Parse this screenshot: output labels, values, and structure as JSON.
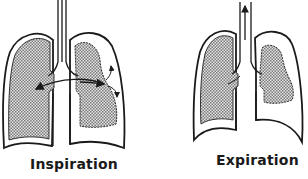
{
  "figure": {
    "panels": [
      {
        "id": "inspiration",
        "label": "Inspiration",
        "description": "Left lung inflated; air shunted from right lung across carina; right chest wall with outward arrows"
      },
      {
        "id": "expiration",
        "label": "Expiration",
        "description": "Air exits upward through trachea (arrow); right lung expands slightly"
      }
    ],
    "colors": {
      "stroke": "#1a1a1a",
      "lung_fill": "#bdbdbd",
      "background": "#ffffff"
    }
  }
}
